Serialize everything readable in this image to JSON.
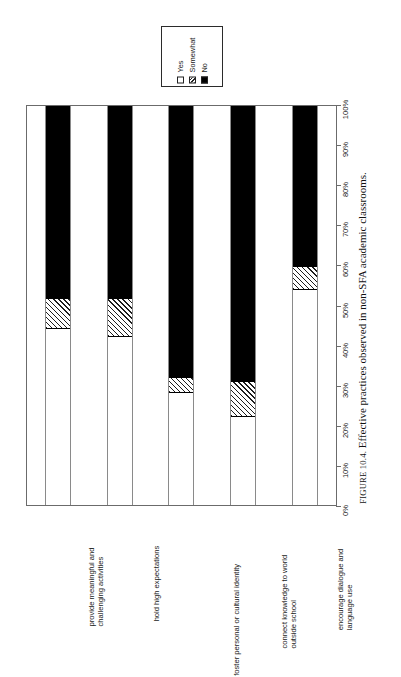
{
  "legend": {
    "name": "chart-legend",
    "entries": [
      {
        "label": "Yes",
        "swatch": "white-square-icon"
      },
      {
        "label": "Somewhat",
        "swatch": "hatched-square-icon"
      },
      {
        "label": "No",
        "swatch": "black-square-icon"
      }
    ]
  },
  "caption": {
    "figure_label": "FIGURE 10.4.",
    "text": "Effective practices observed in non-SFA academic classrooms."
  },
  "axis": {
    "tick_labels": [
      "0%",
      "10%",
      "20%",
      "30%",
      "40%",
      "50%",
      "60%",
      "70%",
      "80%",
      "90%",
      "100%"
    ]
  },
  "chart_data": {
    "type": "bar",
    "orientation": "stacked-vertical-rotated",
    "title": "",
    "subtitle": "",
    "xlabel": "",
    "ylabel": "",
    "ylim": [
      0,
      100
    ],
    "grid": false,
    "legend_position": "top",
    "categories": [
      "provide meaningful and challenging activities",
      "hold high expectations",
      "foster personal or cultural identity",
      "connect knowledge to world outside school",
      "encourage dialogue and language use"
    ],
    "category_lines": [
      [
        "provide meaningful and",
        "challenging activities"
      ],
      [
        "hold high expectations",
        ""
      ],
      [
        "foster personal or cultural identity",
        ""
      ],
      [
        "connect knowledge to world",
        "outside school"
      ],
      [
        "encourage dialogue and",
        "language use"
      ]
    ],
    "series": [
      {
        "name": "Yes",
        "values": [
          44,
          42,
          28,
          22,
          54
        ]
      },
      {
        "name": "Somewhat",
        "values": [
          8,
          10,
          4,
          9,
          6
        ]
      },
      {
        "name": "No",
        "values": [
          48,
          48,
          68,
          69,
          40
        ]
      }
    ],
    "colors": {
      "Yes": "#ffffff",
      "Somewhat": "#ffffff",
      "No": "#000000",
      "outline": "#000000"
    }
  }
}
